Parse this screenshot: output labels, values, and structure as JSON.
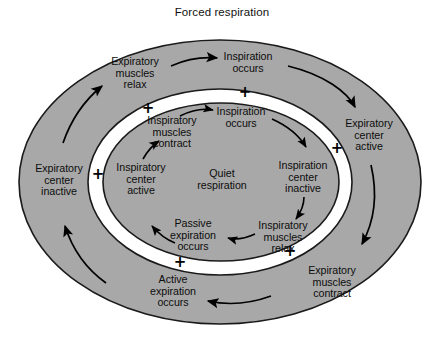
{
  "figure": {
    "title": "Forced respiration",
    "width": 444,
    "height": 341,
    "colors": {
      "ring_fill": "#a8a8a8",
      "gap_fill": "#ffffff",
      "outline": "#1a1a1a",
      "text": "#0d0d0d",
      "background": "#ffffff"
    }
  },
  "diagram": {
    "type": "cycle-diagram",
    "outer_cycle_name": "Forced respiration",
    "inner_cycle_name": "Quiet respiration",
    "outer_labels": [
      {
        "id": "outer-inspiration-occurs",
        "text": "Inspiration\noccurs",
        "x": 248,
        "y": 63
      },
      {
        "id": "outer-expiratory-center-active",
        "text": "Expiratory\ncenter\nactive",
        "x": 369,
        "y": 135
      },
      {
        "id": "outer-expiratory-muscles-contract",
        "text": "Expiratory\nmuscles\ncontract",
        "x": 332,
        "y": 282
      },
      {
        "id": "outer-active-expiration-occurs",
        "text": "Active\nexpiration\noccurs",
        "x": 173,
        "y": 291
      },
      {
        "id": "outer-expiratory-center-inactive",
        "text": "Expiratory\ncenter\ninactive",
        "x": 59,
        "y": 180
      },
      {
        "id": "outer-expiratory-muscles-relax",
        "text": "Expiratory\nmuscles\nrelax",
        "x": 135,
        "y": 73
      }
    ],
    "inner_labels": [
      {
        "id": "inner-inspiration-occurs",
        "text": "Inspiration\noccurs",
        "x": 241,
        "y": 118
      },
      {
        "id": "inner-inspiration-center-inactive",
        "text": "Inspiration\ncenter\ninactive",
        "x": 303,
        "y": 177
      },
      {
        "id": "inner-inspiratory-muscles-relax",
        "text": "Inspiratory\nmuscles\nrelax",
        "x": 283,
        "y": 237
      },
      {
        "id": "inner-passive-expiration-occurs",
        "text": "Passive\nexpiration\noccurs",
        "x": 193,
        "y": 235
      },
      {
        "id": "inner-inspiratory-center-active",
        "text": "Inspiratory\ncenter\nactive",
        "x": 141,
        "y": 179
      },
      {
        "id": "inner-inspiratory-muscles-contract",
        "text": "Inspiratory\nmuscles\ncontract",
        "x": 172,
        "y": 132
      },
      {
        "id": "inner-center-caption",
        "text": "Quiet\nrespiration",
        "x": 222,
        "y": 180
      }
    ],
    "plus_signs": [
      {
        "id": "plus-top-right",
        "symbol": "+",
        "x": 245,
        "y": 92
      },
      {
        "id": "plus-top-left",
        "symbol": "+",
        "x": 148,
        "y": 108
      },
      {
        "id": "plus-right",
        "symbol": "+",
        "x": 337,
        "y": 148
      },
      {
        "id": "plus-left",
        "symbol": "+",
        "x": 98,
        "y": 174
      },
      {
        "id": "plus-bottom-right",
        "symbol": "+",
        "x": 290,
        "y": 251
      },
      {
        "id": "plus-bottom-left",
        "symbol": "+",
        "x": 180,
        "y": 262
      }
    ]
  }
}
